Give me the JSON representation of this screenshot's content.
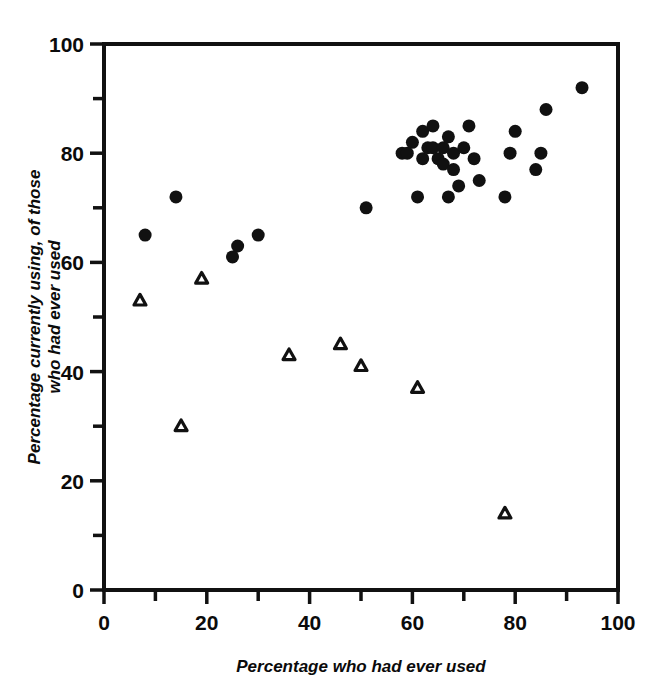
{
  "figure": {
    "background_color": "#ffffff",
    "ink_color": "#111111"
  },
  "chart_data": {
    "type": "scatter",
    "title": "",
    "subtitle": "",
    "xlabel": "Percentage who had ever used",
    "ylabel": "Percentage currently using, of those who had ever used",
    "ylabel_lines": [
      "Percentage currently using, of those",
      "who had ever used"
    ],
    "xlim": [
      0,
      100
    ],
    "ylim": [
      0,
      100
    ],
    "x_ticks_major": [
      0,
      20,
      40,
      60,
      80,
      100
    ],
    "x_ticks_minor": [
      10,
      30,
      50,
      70,
      90
    ],
    "x_tick_labels": [
      "0",
      "20",
      "40",
      "60",
      "80",
      "100"
    ],
    "y_ticks_major": [
      0,
      20,
      40,
      60,
      80,
      100
    ],
    "y_ticks_minor": [
      10,
      30,
      50,
      70,
      90
    ],
    "y_tick_labels": [
      "0",
      "20",
      "40",
      "60",
      "80",
      "100"
    ],
    "grid": false,
    "legend": false,
    "legend_position": "none",
    "axis_style": "left-and-top-spines-with-bottom-rule",
    "series": [
      {
        "name": "filled-circle",
        "marker": "circle",
        "marker_filled": true,
        "marker_size": 13,
        "color": "#111111",
        "points": [
          [
            8,
            65
          ],
          [
            14,
            72
          ],
          [
            25,
            61
          ],
          [
            26,
            63
          ],
          [
            30,
            65
          ],
          [
            51,
            70
          ],
          [
            58,
            80
          ],
          [
            59,
            80
          ],
          [
            60,
            82
          ],
          [
            61,
            72
          ],
          [
            62,
            84
          ],
          [
            62,
            79
          ],
          [
            63,
            81
          ],
          [
            64,
            85
          ],
          [
            64,
            81
          ],
          [
            65,
            79
          ],
          [
            66,
            78
          ],
          [
            66,
            81
          ],
          [
            67,
            72
          ],
          [
            67,
            83
          ],
          [
            68,
            80
          ],
          [
            68,
            77
          ],
          [
            69,
            74
          ],
          [
            70,
            81
          ],
          [
            71,
            85
          ],
          [
            72,
            79
          ],
          [
            73,
            75
          ],
          [
            78,
            72
          ],
          [
            79,
            80
          ],
          [
            80,
            84
          ],
          [
            84,
            77
          ],
          [
            85,
            80
          ],
          [
            86,
            88
          ],
          [
            93,
            92
          ]
        ]
      },
      {
        "name": "open-triangle",
        "marker": "triangle",
        "marker_filled": false,
        "marker_size": 13,
        "color": "#111111",
        "points": [
          [
            7,
            53
          ],
          [
            15,
            30
          ],
          [
            19,
            57
          ],
          [
            36,
            43
          ],
          [
            46,
            45
          ],
          [
            50,
            41
          ],
          [
            61,
            37
          ],
          [
            78,
            14
          ]
        ]
      }
    ]
  }
}
